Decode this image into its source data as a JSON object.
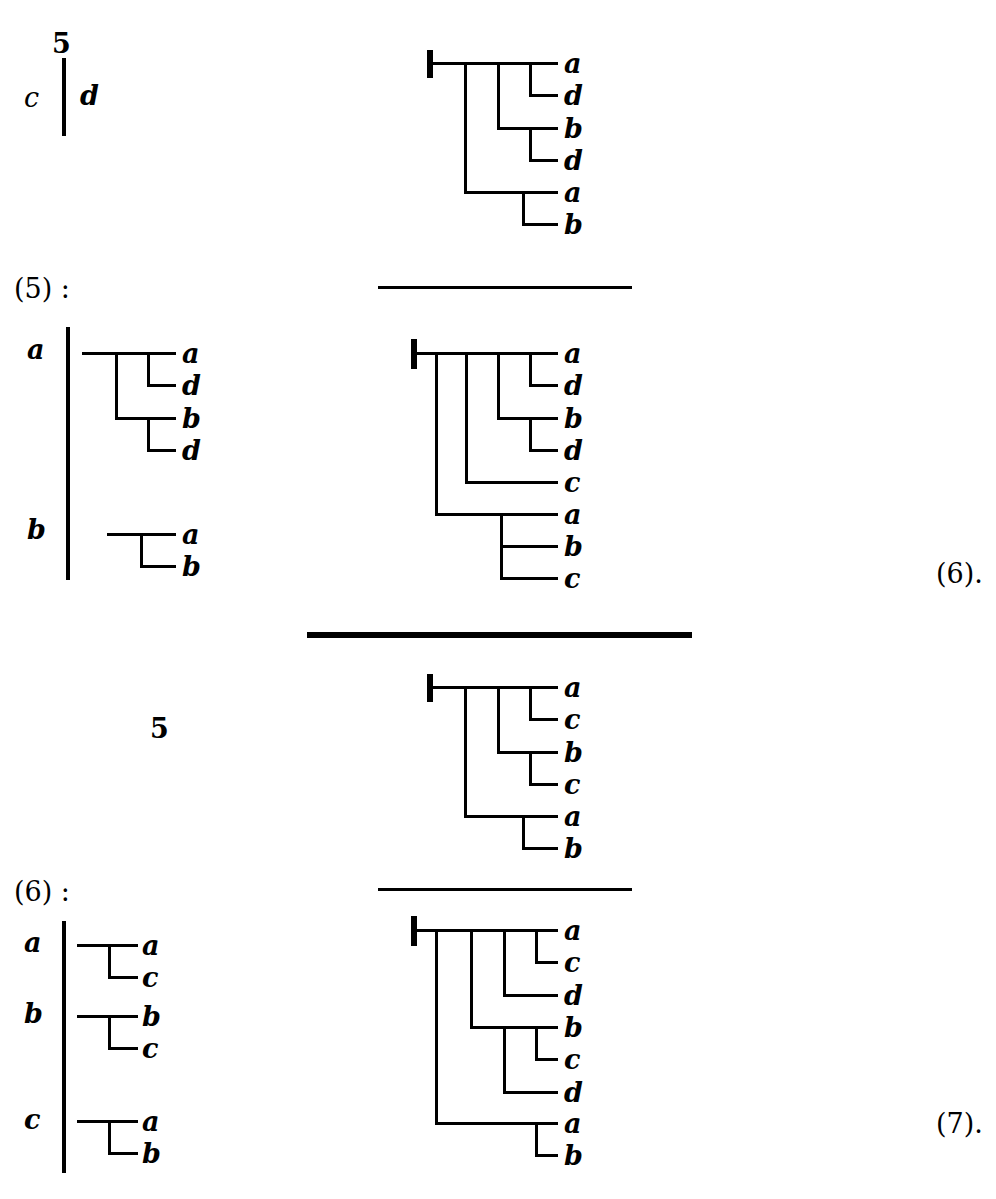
{
  "page": {
    "width": 996,
    "height": 1199,
    "background": "#ffffff",
    "ink": "#000000"
  },
  "top_fragment": {
    "count_label": "5",
    "left_symbol": "c",
    "right_symbol": "d"
  },
  "section_labels": {
    "five": "(5) :",
    "six": "(6) :",
    "middle_count": "5"
  },
  "equation_numbers": {
    "six": "(6).",
    "seven": "(7)."
  },
  "groups": {
    "five": {
      "rows": [
        {
          "key": "a",
          "leaves": [
            "a",
            "d",
            "b",
            "d"
          ]
        },
        {
          "key": "b",
          "leaves": [
            "a",
            "b"
          ]
        }
      ]
    },
    "six": {
      "rows": [
        {
          "key": "a",
          "leaves": [
            "a",
            "c"
          ]
        },
        {
          "key": "b",
          "leaves": [
            "b",
            "c"
          ]
        },
        {
          "key": "c",
          "leaves": [
            "a",
            "b"
          ]
        }
      ]
    }
  },
  "trees": {
    "tree1": {
      "name": "tree-top-right",
      "leaves": [
        "a",
        "d",
        "b",
        "d",
        "a",
        "b"
      ]
    },
    "tree2": {
      "name": "tree-second-row",
      "leaves": [
        "a",
        "d",
        "b",
        "d",
        "c",
        "a",
        "b",
        "c"
      ]
    },
    "tree3": {
      "name": "tree-third-row",
      "leaves": [
        "a",
        "c",
        "b",
        "c",
        "a",
        "b"
      ]
    },
    "tree4": {
      "name": "tree-fourth-row",
      "leaves": [
        "a",
        "c",
        "d",
        "b",
        "c",
        "d",
        "a",
        "b"
      ]
    }
  },
  "rules": {
    "thin_1": "separator",
    "thick_1": "separator",
    "thin_2": "separator"
  }
}
